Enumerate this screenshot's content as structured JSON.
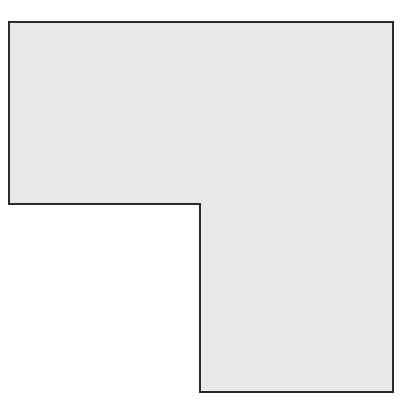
{
  "figure": {
    "shape": "L-shape",
    "fill": "#e8e8e8",
    "stroke": "#2a2a2a",
    "stroke_width": 2,
    "points": "9,22 393,22 393,392 200,392 200,204 9,204"
  }
}
